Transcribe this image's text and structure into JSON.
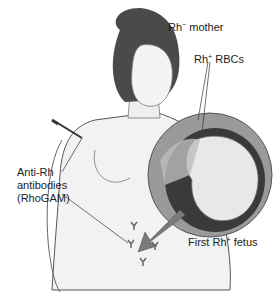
{
  "figure": {
    "labels": {
      "mother": {
        "prefix": "Rh",
        "sup": "−",
        "suffix": " mother"
      },
      "rbcs": {
        "prefix": "Rh",
        "sup": "+",
        "suffix": " RBCs"
      },
      "antibodies": {
        "line1": "Anti-Rh",
        "line2": "antibodies",
        "line3": "(RhoGAM)"
      },
      "fetus": {
        "prefix": "First Rh",
        "sup": "+",
        "suffix": " fetus"
      }
    },
    "colors": {
      "skin": "#f2f2f2",
      "outline": "#555555",
      "hair": "#4a4a4a",
      "uterus": "#9a9a9a",
      "uterus_inner": "#3a3a3a",
      "fetus": "#e8e8e8",
      "arrow": "#7a7a7a"
    }
  }
}
